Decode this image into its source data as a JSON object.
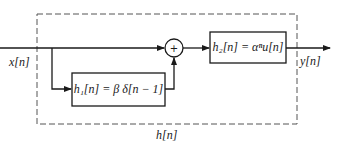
{
  "diagram": {
    "type": "block-diagram",
    "input_label": "x[n]",
    "output_label": "y[n]",
    "overall_system_label": "h[n]",
    "blocks": [
      {
        "id": "h1",
        "label": "h₁[n] = β δ[n − 1]"
      },
      {
        "id": "h2",
        "label": "h₂[n] = αⁿu[n]"
      }
    ],
    "summer": {
      "symbol": "+"
    },
    "connections": [
      {
        "from": "x[n]",
        "to": "summer"
      },
      {
        "from": "x[n]",
        "to": "h1"
      },
      {
        "from": "h1",
        "to": "summer"
      },
      {
        "from": "summer",
        "to": "h2"
      },
      {
        "from": "h2",
        "to": "y[n]"
      }
    ],
    "colors": {
      "line": "#1a1a1a",
      "dashed_border": "#555555",
      "background": "#ffffff"
    }
  }
}
